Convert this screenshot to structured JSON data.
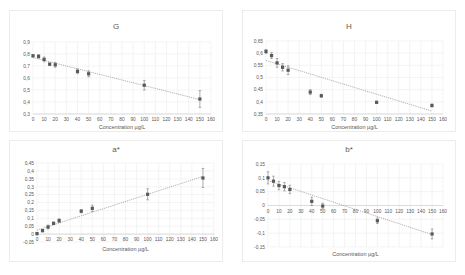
{
  "chart_data": [
    {
      "type": "scatter",
      "title": "G",
      "xlabel": "Concentration µg/L",
      "ylabel": "",
      "xlim": [
        0,
        160
      ],
      "ylim": [
        0.3,
        0.9
      ],
      "xticks": [
        0,
        10,
        20,
        30,
        40,
        50,
        60,
        70,
        80,
        90,
        100,
        110,
        120,
        130,
        140,
        150,
        160
      ],
      "yticks": [
        0.3,
        0.4,
        0.5,
        0.6,
        0.7,
        0.8,
        0.9
      ],
      "ytick_labels": [
        "0,3",
        "0,4",
        "0,5",
        "0,6",
        "0,7",
        "0,8",
        "0,9"
      ],
      "grid": true,
      "trendline": "linear",
      "x": [
        0,
        5,
        10,
        15,
        20,
        40,
        50,
        100,
        150
      ],
      "y": [
        0.785,
        0.78,
        0.755,
        0.715,
        0.71,
        0.655,
        0.635,
        0.54,
        0.425
      ],
      "error": [
        0.01,
        0.015,
        0.02,
        0.01,
        0.02,
        0.02,
        0.025,
        0.04,
        0.07
      ],
      "trend": [
        [
          0,
          0.77
        ],
        [
          150,
          0.42
        ]
      ]
    },
    {
      "type": "scatter",
      "title": "H",
      "xlabel": "Concentration µg/L",
      "ylabel": "",
      "xlim": [
        0,
        160
      ],
      "ylim": [
        0.35,
        0.65
      ],
      "xticks": [
        0,
        10,
        20,
        30,
        40,
        50,
        60,
        70,
        80,
        90,
        100,
        110,
        120,
        130,
        140,
        150,
        160
      ],
      "yticks": [
        0.35,
        0.4,
        0.45,
        0.5,
        0.55,
        0.6,
        0.65
      ],
      "ytick_labels": [
        "0,35",
        "0,4",
        "0,45",
        "0,5",
        "0,55",
        "0,6",
        "0,65"
      ],
      "grid": true,
      "trendline": "linear",
      "x": [
        0,
        5,
        10,
        15,
        20,
        40,
        50,
        100,
        150
      ],
      "y": [
        0.607,
        0.59,
        0.56,
        0.542,
        0.53,
        0.44,
        0.425,
        0.398,
        0.385
      ],
      "error": [
        0.008,
        0.012,
        0.018,
        0.015,
        0.018,
        0.01,
        0.006,
        0.004,
        0.006
      ],
      "trend": [
        [
          0,
          0.57
        ],
        [
          150,
          0.362
        ]
      ]
    },
    {
      "type": "scatter",
      "title": "a*",
      "xlabel": "Concentration µg/L",
      "ylabel": "",
      "xlim": [
        0,
        160
      ],
      "ylim": [
        -0.05,
        0.45
      ],
      "xticks": [
        0,
        10,
        20,
        30,
        40,
        50,
        60,
        70,
        80,
        90,
        100,
        110,
        120,
        130,
        140,
        150,
        160
      ],
      "yticks": [
        -0.05,
        0,
        0.05,
        0.1,
        0.15,
        0.2,
        0.25,
        0.3,
        0.35,
        0.4,
        0.45
      ],
      "ytick_labels": [
        "-0,05",
        "0",
        "0,05",
        "0,1",
        "0,15",
        "0,2",
        "0,25",
        "0,3",
        "0,35",
        "0,4",
        "0,45"
      ],
      "grid": true,
      "trendline": "linear",
      "x": [
        0,
        5,
        10,
        15,
        20,
        40,
        50,
        100,
        150
      ],
      "y": [
        0.003,
        0.022,
        0.045,
        0.068,
        0.085,
        0.145,
        0.163,
        0.252,
        0.355
      ],
      "error": [
        0.008,
        0.008,
        0.012,
        0.008,
        0.012,
        0.01,
        0.02,
        0.035,
        0.06
      ],
      "trend": [
        [
          0,
          0.025
        ],
        [
          150,
          0.365
        ]
      ]
    },
    {
      "type": "scatter",
      "title": "b*",
      "xlabel": "Concentration µg/L",
      "ylabel": "",
      "xlim": [
        0,
        160
      ],
      "ylim": [
        -0.15,
        0.15
      ],
      "xticks": [
        0,
        10,
        20,
        30,
        40,
        50,
        60,
        70,
        80,
        90,
        100,
        110,
        120,
        130,
        140,
        150,
        160
      ],
      "yticks": [
        -0.15,
        -0.1,
        -0.05,
        0,
        0.05,
        0.1,
        0.15
      ],
      "ytick_labels": [
        "-0,15",
        "-0,1",
        "-0,05",
        "0",
        "0,05",
        "0,1",
        "0,15"
      ],
      "grid": true,
      "trendline": "linear",
      "x": [
        0,
        5,
        10,
        15,
        20,
        40,
        50,
        100,
        150
      ],
      "y": [
        0.1,
        0.088,
        0.072,
        0.068,
        0.058,
        0.015,
        -0.002,
        -0.055,
        -0.103
      ],
      "error": [
        0.022,
        0.018,
        0.015,
        0.015,
        0.015,
        0.015,
        0.01,
        0.01,
        0.018
      ],
      "trend": [
        [
          0,
          0.09
        ],
        [
          150,
          -0.105
        ]
      ]
    }
  ]
}
